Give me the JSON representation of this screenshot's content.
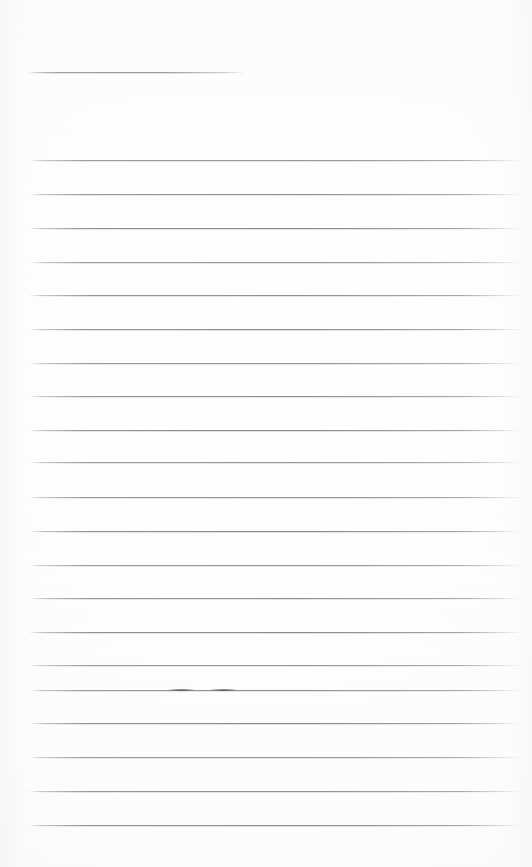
{
  "page": {
    "kind": "scanned-lined-paper",
    "width": 532,
    "height": 867,
    "background_color": "#fdfdfd",
    "rule_color": "#7c7f87",
    "ink_color": "#3c3e44"
  },
  "title_rule": {
    "label": "title-write-on-line",
    "x": 28,
    "y": 72,
    "width": 218
  },
  "ruled_lines": {
    "label": "body-write-on-lines",
    "start_x": 28,
    "end_x": 521,
    "first_y": 160,
    "spacing": 33.7,
    "count": 21,
    "y_positions": [
      160,
      194,
      228,
      262,
      295,
      329,
      363,
      396,
      430,
      462,
      497,
      531,
      565,
      598,
      632,
      665,
      690,
      723,
      757,
      791,
      825
    ]
  },
  "pen_marks": [
    {
      "label": "pen-dash-left",
      "x": 168,
      "y": 689,
      "width": 27
    },
    {
      "label": "pen-dash-right",
      "x": 210,
      "y": 689,
      "width": 27
    }
  ],
  "ghost_text": {
    "top": "               ",
    "bottom": "                         "
  }
}
